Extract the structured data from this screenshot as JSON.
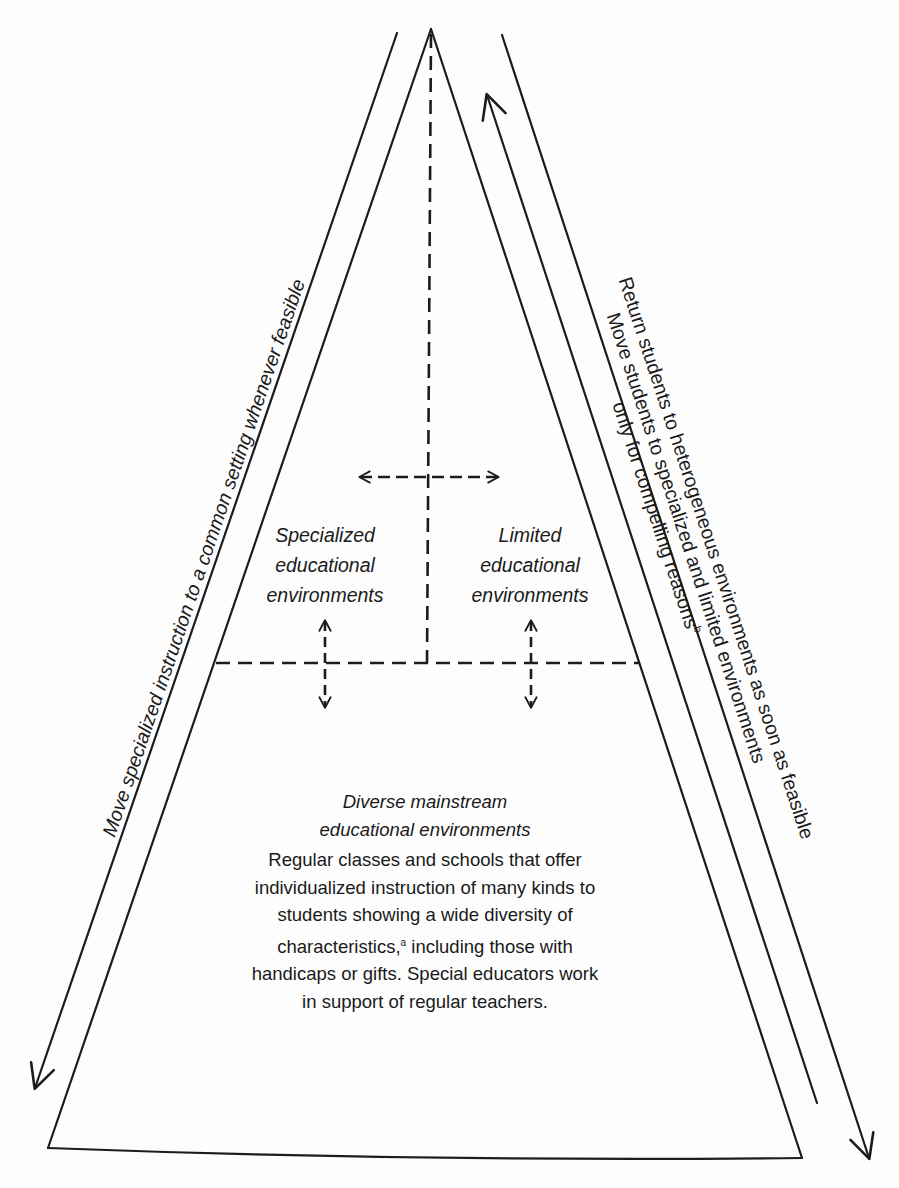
{
  "diagram": {
    "type": "pyramid-cascade",
    "zones": {
      "specialized": {
        "title_lines": [
          "Specialized",
          "educational",
          "environments"
        ]
      },
      "limited": {
        "title_lines": [
          "Limited",
          "educational",
          "environments"
        ]
      },
      "mainstream": {
        "title_lines": [
          "Diverse mainstream",
          "educational environments"
        ],
        "body_lines": [
          "Regular classes and schools that offer",
          "individualized instruction of many kinds to",
          "students showing a wide diversity of",
          "characteristics,",
          "including those with",
          "handicaps or gifts. Special educators work",
          "in support of regular teachers."
        ],
        "footnote_a": "a"
      }
    },
    "side_labels": {
      "left": "Move specialized instruction to a common setting whenever feasible",
      "right_outer": "Return students to heterogeneous environments as soon as feasible",
      "right_inner_line1": "Move students to specialized and limited environments",
      "right_inner_line2": "only for compelling reasons",
      "footnote_b": "b"
    },
    "colors": {
      "ink": "#1c1c1c",
      "background": "#fdfdfd"
    }
  }
}
